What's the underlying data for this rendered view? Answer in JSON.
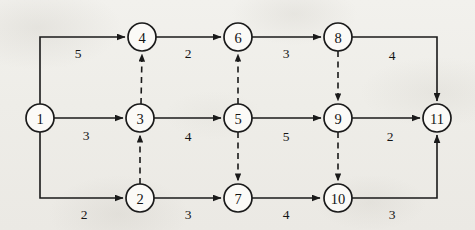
{
  "diagram": {
    "type": "directed-graph",
    "canvas": {
      "width": 475,
      "height": 230
    },
    "colors": {
      "background": "#efeeea",
      "stroke": "#1a1a1a",
      "node_fill": "#fbfaf7",
      "text": "#141414"
    },
    "node_radius": 14,
    "nodes": [
      {
        "id": "1",
        "label": "1",
        "x": 40,
        "y": 118
      },
      {
        "id": "2",
        "label": "2",
        "x": 140,
        "y": 198
      },
      {
        "id": "3",
        "label": "3",
        "x": 140,
        "y": 118
      },
      {
        "id": "4",
        "label": "4",
        "x": 142,
        "y": 37
      },
      {
        "id": "5",
        "label": "5",
        "x": 238,
        "y": 118
      },
      {
        "id": "6",
        "label": "6",
        "x": 238,
        "y": 37
      },
      {
        "id": "7",
        "label": "7",
        "x": 238,
        "y": 198
      },
      {
        "id": "8",
        "label": "8",
        "x": 338,
        "y": 37
      },
      {
        "id": "9",
        "label": "9",
        "x": 338,
        "y": 118
      },
      {
        "id": "10",
        "label": "10",
        "x": 338,
        "y": 198
      },
      {
        "id": "11",
        "label": "11",
        "x": 437,
        "y": 118
      }
    ],
    "edges": [
      {
        "from": "1",
        "to": "4",
        "weight": "5",
        "style": "solid",
        "shape": "elbow-up",
        "path": "M 40 104 L 40 37 L 125 37",
        "label_x": 78,
        "label_y": 53
      },
      {
        "from": "1",
        "to": "3",
        "weight": "3",
        "style": "solid",
        "shape": "straight",
        "path": "M 54 118 L 123 118",
        "label_x": 86,
        "label_y": 135
      },
      {
        "from": "1",
        "to": "2",
        "weight": "2",
        "style": "solid",
        "shape": "elbow-down",
        "path": "M 40 132 L 40 198 L 123 198",
        "label_x": 84,
        "label_y": 214
      },
      {
        "from": "4",
        "to": "6",
        "weight": "2",
        "style": "solid",
        "shape": "straight",
        "path": "M 156 37 L 221 37",
        "label_x": 188,
        "label_y": 53
      },
      {
        "from": "6",
        "to": "8",
        "weight": "3",
        "style": "solid",
        "shape": "straight",
        "path": "M 252 37 L 321 37",
        "label_x": 286,
        "label_y": 53
      },
      {
        "from": "8",
        "to": "11",
        "weight": "4",
        "style": "solid",
        "shape": "elbow-down",
        "path": "M 352 37 L 437 37 L 437 101",
        "label_x": 392,
        "label_y": 55
      },
      {
        "from": "3",
        "to": "5",
        "weight": "4",
        "style": "solid",
        "shape": "straight",
        "path": "M 154 118 L 221 118",
        "label_x": 188,
        "label_y": 136
      },
      {
        "from": "5",
        "to": "9",
        "weight": "5",
        "style": "solid",
        "shape": "straight",
        "path": "M 252 118 L 321 118",
        "label_x": 286,
        "label_y": 136
      },
      {
        "from": "9",
        "to": "11",
        "weight": "2",
        "style": "solid",
        "shape": "straight",
        "path": "M 352 118 L 420 118",
        "label_x": 390,
        "label_y": 136
      },
      {
        "from": "2",
        "to": "7",
        "weight": "3",
        "style": "solid",
        "shape": "straight",
        "path": "M 154 198 L 221 198",
        "label_x": 188,
        "label_y": 214
      },
      {
        "from": "7",
        "to": "10",
        "weight": "4",
        "style": "solid",
        "shape": "straight",
        "path": "M 252 198 L 320 198",
        "label_x": 286,
        "label_y": 214
      },
      {
        "from": "10",
        "to": "11",
        "weight": "3",
        "style": "solid",
        "shape": "elbow-up",
        "path": "M 352 198 L 437 198 L 437 135",
        "label_x": 392,
        "label_y": 214
      },
      {
        "from": "2",
        "to": "3",
        "weight": "",
        "style": "dashed",
        "shape": "vertical-up",
        "path": "M 140 184 L 140 135",
        "label_x": null,
        "label_y": null
      },
      {
        "from": "3",
        "to": "4",
        "weight": "",
        "style": "dashed",
        "shape": "vertical-up",
        "path": "M 141 104 L 142 54",
        "label_x": null,
        "label_y": null
      },
      {
        "from": "5",
        "to": "6",
        "weight": "",
        "style": "dashed",
        "shape": "vertical-up",
        "path": "M 238 104 L 238 54",
        "label_x": null,
        "label_y": null
      },
      {
        "from": "5",
        "to": "7",
        "weight": "",
        "style": "dashed",
        "shape": "vertical-down",
        "path": "M 238 132 L 238 181",
        "label_x": null,
        "label_y": null
      },
      {
        "from": "8",
        "to": "9",
        "weight": "",
        "style": "dashed",
        "shape": "vertical-down",
        "path": "M 338 51 L 338 101",
        "label_x": null,
        "label_y": null
      },
      {
        "from": "9",
        "to": "10",
        "weight": "",
        "style": "dashed",
        "shape": "vertical-down",
        "path": "M 338 132 L 338 181",
        "label_x": null,
        "label_y": null
      }
    ]
  }
}
